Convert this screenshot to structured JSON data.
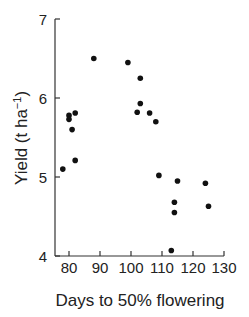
{
  "chart_data": {
    "type": "scatter",
    "title": "",
    "xlabel": "Days to 50% flowering",
    "ylabel": "Yield (t ha",
    "ylabel_superscript": "−1",
    "ylabel_close": ")",
    "xlim": [
      75.5,
      130
    ],
    "ylim": [
      4,
      7
    ],
    "xticks": [
      80,
      90,
      100,
      110,
      120,
      130
    ],
    "yticks": [
      4,
      5,
      6,
      7
    ],
    "grid": false,
    "legend": null,
    "points": [
      {
        "x": 78,
        "y": 5.1
      },
      {
        "x": 80,
        "y": 5.78
      },
      {
        "x": 80,
        "y": 5.73
      },
      {
        "x": 81,
        "y": 5.6
      },
      {
        "x": 82,
        "y": 5.21
      },
      {
        "x": 82,
        "y": 5.81
      },
      {
        "x": 88,
        "y": 6.5
      },
      {
        "x": 99,
        "y": 6.45
      },
      {
        "x": 103,
        "y": 6.25
      },
      {
        "x": 102,
        "y": 5.82
      },
      {
        "x": 103,
        "y": 5.93
      },
      {
        "x": 106,
        "y": 5.81
      },
      {
        "x": 108,
        "y": 5.7
      },
      {
        "x": 109,
        "y": 5.02
      },
      {
        "x": 115,
        "y": 4.95
      },
      {
        "x": 114,
        "y": 4.68
      },
      {
        "x": 114,
        "y": 4.55
      },
      {
        "x": 113,
        "y": 4.07
      },
      {
        "x": 124,
        "y": 4.92
      },
      {
        "x": 125,
        "y": 4.63
      }
    ]
  },
  "style": {
    "point_color": "#111111",
    "axis_color": "#333333"
  }
}
